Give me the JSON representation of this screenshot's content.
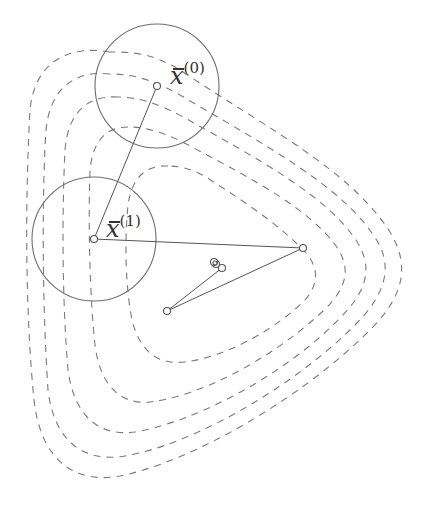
{
  "diagram": {
    "type": "trust-region-iterations",
    "colors": {
      "contour": "#7a7a7a",
      "circle": "#6e6e6e",
      "path": "#555555",
      "background": "#ffffff"
    },
    "labels": [
      {
        "id": "x0",
        "base": "x",
        "sup": "(0)",
        "text": "x̄(0)"
      },
      {
        "id": "x1",
        "base": "x",
        "sup": "(1)",
        "text": "x̄(1)"
      }
    ],
    "trust_regions": [
      {
        "center": [
          157,
          86
        ],
        "radius": 62,
        "label": "x̄(0)"
      },
      {
        "center": [
          94,
          239
        ],
        "radius": 62,
        "label": "x̄(1)"
      }
    ],
    "iterates": [
      [
        157,
        86
      ],
      [
        94,
        239
      ],
      [
        303,
        248
      ],
      [
        167,
        311
      ],
      [
        222,
        268
      ],
      [
        216,
        264
      ],
      [
        215,
        263
      ]
    ],
    "contour_levels": 5
  }
}
